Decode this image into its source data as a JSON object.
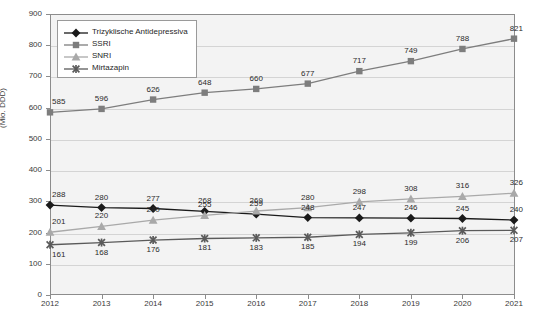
{
  "chart_data": {
    "type": "line",
    "title": "",
    "xlabel": "",
    "ylabel": "(Mio. DDD)",
    "categories": [
      "2012",
      "2013",
      "2014",
      "2015",
      "2016",
      "2017",
      "2018",
      "2019",
      "2020",
      "2021"
    ],
    "ylim": [
      0,
      900
    ],
    "ytick_step": 100,
    "yticks": [
      0,
      100,
      200,
      300,
      400,
      500,
      600,
      700,
      800,
      900
    ],
    "grid": true,
    "legend_position": "top-left",
    "series": [
      {
        "name": "Trizyklische Antidepressiva",
        "marker": "diamond",
        "color": "#1a1a1a",
        "label_side": "above",
        "values": [
          288,
          280,
          277,
          268,
          259,
          248,
          247,
          246,
          245,
          240
        ]
      },
      {
        "name": "SSRI",
        "marker": "square",
        "color": "#7d7d7d",
        "label_side": "above",
        "values": [
          585,
          596,
          626,
          648,
          660,
          677,
          717,
          749,
          788,
          821
        ]
      },
      {
        "name": "SNRI",
        "marker": "triangle",
        "color": "#a9a9a9",
        "label_side": "above",
        "values": [
          201,
          220,
          240,
          255,
          269,
          280,
          298,
          308,
          316,
          326
        ]
      },
      {
        "name": "Mirtazapin",
        "marker": "x",
        "color": "#5a5a5a",
        "label_side": "below",
        "values": [
          161,
          168,
          176,
          181,
          183,
          185,
          194,
          199,
          206,
          207
        ]
      }
    ]
  },
  "legend": {
    "items": [
      {
        "label": "Trizyklische Antidepressiva"
      },
      {
        "label": "SSRI"
      },
      {
        "label": "SNRI"
      },
      {
        "label": "Mirtazapin"
      }
    ]
  }
}
